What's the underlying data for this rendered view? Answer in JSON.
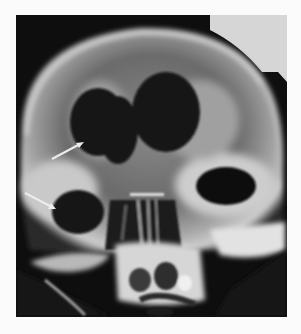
{
  "figure": {
    "type": "radiograph",
    "colors": {
      "background": "#fbfbfb",
      "film_dark": "#0e0e0e",
      "bone_light": "#d8d8d8",
      "corner_gray": "#d6d6d6",
      "arrow": "#e8e8e8"
    },
    "arrows": [
      {
        "label": "arrow-upper",
        "from": [
          52,
          159
        ],
        "to": [
          82,
          143
        ]
      },
      {
        "label": "arrow-lower",
        "from": [
          25,
          193
        ],
        "to": [
          55,
          208
        ]
      }
    ]
  }
}
